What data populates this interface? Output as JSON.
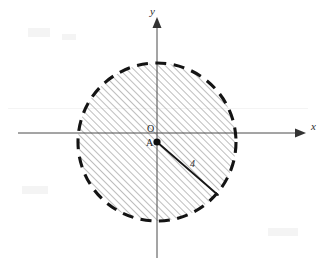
{
  "figure": {
    "background_color": "#ffffff",
    "axis_color": "#4a4a4a",
    "boundary_color": "#141414",
    "hatch_color": "#8d8d8d",
    "labels": {
      "x_axis": "x",
      "y_axis": "y",
      "origin": "O",
      "center": "A",
      "radius": "4"
    },
    "geometry": {
      "origin_px": {
        "x": 157,
        "y": 133
      },
      "center_px": {
        "x": 157,
        "y": 142
      },
      "radius_px": 80,
      "radius_value": 4,
      "boundary_style": "dashed",
      "fill_style": "diagonal-hatch-45",
      "radius_endpoint_px": {
        "x": 218,
        "y": 195
      }
    }
  }
}
